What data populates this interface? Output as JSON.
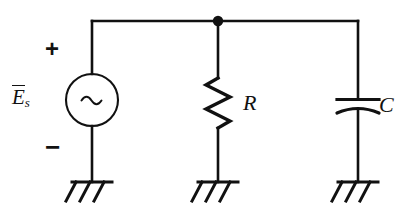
{
  "figure": {
    "name": "ac-source-rc-parallel-circuit",
    "background_color": "#ffffff",
    "line_color": "#111111",
    "width": 410,
    "height": 218
  },
  "labels": {
    "source": {
      "symbol": "E",
      "subscript": "s",
      "overbar": true,
      "full_text": "E̅s"
    },
    "resistor": "R",
    "capacitor": "C",
    "polarity_plus": "+",
    "polarity_minus": "−"
  },
  "components": [
    {
      "id": "voltage-source",
      "type": "ac-voltage-source",
      "label": "E̅s",
      "glyph": "~",
      "center_x": 92,
      "center_y": 100,
      "radius": 26
    },
    {
      "id": "resistor",
      "type": "resistor",
      "label": "R",
      "center_x": 218,
      "center_y": 103
    },
    {
      "id": "capacitor",
      "type": "capacitor",
      "label": "C",
      "center_x": 358,
      "center_y": 104
    }
  ],
  "nodes": [
    {
      "id": "top-junction",
      "type": "junction-dot",
      "x": 218,
      "y": 21
    }
  ],
  "grounds": [
    {
      "id": "ground-source",
      "x": 92,
      "y": 182
    },
    {
      "id": "ground-resistor",
      "x": 218,
      "y": 182
    },
    {
      "id": "ground-capacitor",
      "x": 358,
      "y": 182
    }
  ],
  "wires": {
    "top_rail_y": 21,
    "left_branch_x": 92,
    "middle_branch_x": 218,
    "right_branch_x": 358
  }
}
